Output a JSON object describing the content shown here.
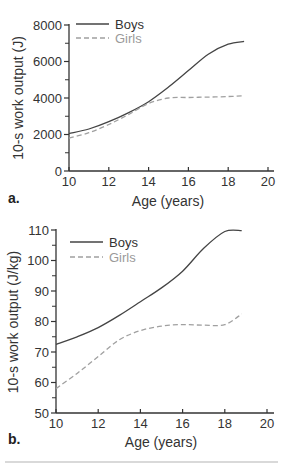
{
  "chart_data": [
    {
      "type": "line",
      "panel": "a.",
      "title": "",
      "xlabel": "Age (years)",
      "ylabel": "10-s work output (J)",
      "xlim": [
        10,
        20
      ],
      "ylim": [
        0,
        8000
      ],
      "x_ticks": [
        10,
        12,
        14,
        16,
        18,
        20
      ],
      "y_ticks": [
        0,
        2000,
        4000,
        6000,
        8000
      ],
      "grid": false,
      "legend_position": "top-left",
      "x": [
        10,
        11,
        12,
        13,
        14,
        15,
        16,
        17,
        18,
        18.8
      ],
      "series": [
        {
          "name": "Boys",
          "style": "solid",
          "color": "#444444",
          "values": [
            2050,
            2300,
            2700,
            3200,
            3800,
            4600,
            5500,
            6400,
            6950,
            7100
          ]
        },
        {
          "name": "Girls",
          "style": "dashed",
          "color": "#a0a0a0",
          "values": [
            1800,
            2100,
            2550,
            3100,
            3700,
            4000,
            4030,
            4050,
            4080,
            4120
          ]
        }
      ]
    },
    {
      "type": "line",
      "panel": "b.",
      "title": "",
      "xlabel": "Age (years)",
      "ylabel": "10-s work output (J/kg)",
      "xlim": [
        10,
        20
      ],
      "ylim": [
        50,
        110
      ],
      "x_ticks": [
        10,
        12,
        14,
        16,
        18,
        20
      ],
      "y_ticks": [
        50,
        60,
        70,
        80,
        90,
        100,
        110
      ],
      "grid": false,
      "legend_position": "top-left",
      "x": [
        10,
        11,
        12,
        13,
        14,
        15,
        16,
        17,
        18,
        18.8
      ],
      "series": [
        {
          "name": "Boys",
          "style": "solid",
          "color": "#444444",
          "values": [
            72.5,
            75,
            78,
            82,
            86.5,
            91,
            96.5,
            104,
            109.5,
            109.8
          ]
        },
        {
          "name": "Girls",
          "style": "dashed",
          "color": "#a0a0a0",
          "values": [
            58,
            63,
            68.5,
            74,
            77,
            78.5,
            79,
            78.8,
            79,
            82.5
          ]
        }
      ]
    }
  ],
  "labels": {
    "a": {
      "panel": "a.",
      "xlabel": "Age (years)",
      "ylabel": "10-s work output (J)",
      "legend_boys": "Boys",
      "legend_girls": "Girls",
      "yticks": [
        "0",
        "2000",
        "4000",
        "6000",
        "8000"
      ],
      "xticks": [
        "10",
        "12",
        "14",
        "16",
        "18",
        "20"
      ]
    },
    "b": {
      "panel": "b.",
      "xlabel": "Age (years)",
      "ylabel": "10-s work output (J/kg)",
      "legend_boys": "Boys",
      "legend_girls": "Girls",
      "yticks": [
        "50",
        "60",
        "70",
        "80",
        "90",
        "100",
        "110"
      ],
      "xticks": [
        "10",
        "12",
        "14",
        "16",
        "18",
        "20"
      ]
    }
  },
  "colors": {
    "boys": "#444444",
    "girls": "#a0a0a0",
    "axis": "#333333",
    "divider": "#cccccc"
  }
}
